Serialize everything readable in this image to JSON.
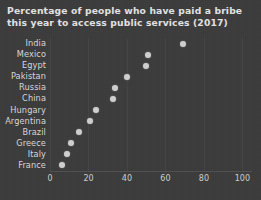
{
  "chart_data": {
    "type": "scatter",
    "title": "Percentage of people who have paid a bribe\nthis year to access public services (2017)",
    "title_line1": "Percentage of people who have paid a bribe",
    "title_line2": "this year to access public services (2017)",
    "xlabel": "",
    "ylabel": "",
    "orientation": "horizontal",
    "categories": [
      "India",
      "Mexico",
      "Egypt",
      "Pakistan",
      "Russia",
      "China",
      "Hungary",
      "Argentina",
      "Brazil",
      "Greece",
      "Italy",
      "France"
    ],
    "values": [
      69,
      51,
      50,
      40,
      34,
      33,
      24,
      21,
      15,
      11,
      9,
      6
    ],
    "xlim": [
      0,
      105
    ],
    "xticks": [
      0,
      20,
      40,
      60,
      80,
      100
    ],
    "xtick_labels": [
      "0",
      "20",
      "40",
      "60",
      "80",
      "100"
    ],
    "grid": "vertical-faint",
    "legend": "none",
    "marker": "circle",
    "colors": {
      "background": "#3b3b3b",
      "marker": "#cfcfcf",
      "title_text": "#e3e3e3",
      "axis_text": "#d0d0d0",
      "gridline": "rgba(255,255,255,0.045)"
    }
  }
}
